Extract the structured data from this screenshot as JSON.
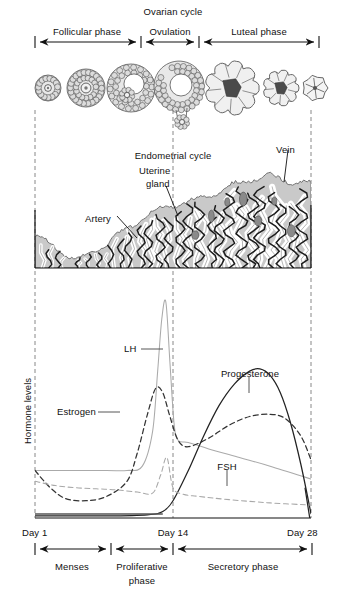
{
  "figure": {
    "width": 344,
    "height": 595
  },
  "ovarian_cycle": {
    "heading": "Ovarian cycle",
    "phases": [
      {
        "label": "Follicular phase",
        "start_day": 1,
        "end_day": 13,
        "x_start": 35,
        "x_end": 140
      },
      {
        "label": "Ovulation",
        "start_day": 13,
        "end_day": 16,
        "x_start": 143,
        "x_end": 198
      },
      {
        "label": "Luteal phase",
        "start_day": 16,
        "end_day": 28,
        "x_start": 201,
        "x_end": 318
      }
    ],
    "follicle_stages": [
      {
        "name": "primordial-follicle",
        "cx": 48,
        "r": 13,
        "type": "ring",
        "antrum": false
      },
      {
        "name": "primary-follicle",
        "cx": 86,
        "r": 19,
        "type": "ring",
        "antrum": false
      },
      {
        "name": "secondary-follicle",
        "cx": 131,
        "r": 24,
        "type": "antral",
        "antrum": true
      },
      {
        "name": "graafian-follicle",
        "cx": 180,
        "r": 25,
        "type": "rupture",
        "antrum": true
      },
      {
        "name": "corpus-luteum",
        "cx": 232,
        "r": 27,
        "type": "luteum",
        "antrum": true
      },
      {
        "name": "regressing-corpus-luteum",
        "cx": 281,
        "r": 18,
        "type": "luteum",
        "antrum": true
      },
      {
        "name": "corpus-albicans",
        "cx": 315,
        "r": 13,
        "type": "albicans",
        "antrum": true
      }
    ]
  },
  "endometrial_cycle": {
    "heading": "Endometrial cycle",
    "annotations": [
      {
        "label": "Artery",
        "name": "artery-label",
        "text_x": 108,
        "text_y": 218,
        "lead_to_x": 136,
        "lead_to_y": 236
      },
      {
        "label": "Uterine\ngland",
        "name": "uterine-gland-label",
        "line1": "Uterine",
        "line2": "gland",
        "text_x": 158,
        "text_y": 186,
        "lead_to_x": 176,
        "lead_to_y": 215
      },
      {
        "label": "Vein",
        "name": "vein-label",
        "text_x": 288,
        "text_y": 152,
        "lead_to_x": 283,
        "lead_to_y": 180
      }
    ]
  },
  "chart_data": {
    "type": "line",
    "xlabel": "",
    "ylabel": "Hormone levels",
    "x_tick_labels": [
      "Day 1",
      "Day 14",
      "Day 28"
    ],
    "x_ticks": [
      1,
      14,
      28
    ],
    "xlim": [
      1,
      28
    ],
    "ylim": [
      0,
      100
    ],
    "grid": false,
    "legend": "inline annotations",
    "series": [
      {
        "name": "LH",
        "style": "solid",
        "color": "#aaaaaa",
        "label_x": 133,
        "label_y": 349,
        "lead_to_x": 163,
        "lead_to_y": 349,
        "x": [
          1,
          4,
          8,
          10,
          11.5,
          12.5,
          13,
          13.4,
          13.8,
          14.2,
          14.6,
          15,
          16,
          18,
          21,
          24,
          28
        ],
        "values": [
          22,
          22,
          22,
          22,
          24,
          40,
          68,
          92,
          100,
          72,
          44,
          36,
          35,
          32,
          28,
          24,
          18
        ]
      },
      {
        "name": "Estrogen",
        "style": "dashed",
        "color": "#333333",
        "label_x": 60,
        "label_y": 413,
        "lead_to_x": 118,
        "lead_to_y": 413,
        "x": [
          1,
          2.5,
          4,
          6,
          8,
          10,
          11,
          12,
          12.8,
          13.5,
          14.2,
          15,
          16,
          18,
          20,
          22,
          24,
          25.5,
          27,
          28
        ],
        "values": [
          22,
          14,
          9,
          8,
          10,
          17,
          30,
          48,
          60,
          58,
          47,
          36,
          33,
          37,
          43,
          47,
          48,
          46,
          38,
          27
        ]
      },
      {
        "name": "Progesterone",
        "style": "solid",
        "color": "#222222",
        "label_x": 253,
        "label_y": 377,
        "lead_to_x": 249,
        "lead_to_y": 393,
        "x": [
          1,
          8,
          12,
          13.5,
          14.5,
          16,
          17.5,
          19,
          20.5,
          22,
          23,
          24,
          25,
          26,
          27,
          28
        ],
        "values": [
          1,
          1,
          1.5,
          3,
          8,
          22,
          38,
          52,
          62,
          68,
          69,
          66,
          58,
          44,
          25,
          2
        ]
      },
      {
        "name": "FSH",
        "style": "dashed",
        "color": "#a8a8a8",
        "label_x": 222,
        "label_y": 466,
        "lead_to_x": 227,
        "lead_to_y": 485,
        "x": [
          1,
          3,
          5,
          7,
          9,
          11,
          12.5,
          13.3,
          13.9,
          14.5,
          15.5,
          17,
          20,
          24,
          28
        ],
        "values": [
          17,
          15,
          14,
          13.5,
          13,
          12,
          11.5,
          20,
          28,
          14,
          11,
          10,
          8.5,
          7,
          6
        ]
      }
    ]
  },
  "axis": {
    "day_labels": [
      {
        "text": "Day 1",
        "x": 35,
        "align": "left"
      },
      {
        "text": "Day 14",
        "x": 173,
        "align": "center"
      },
      {
        "text": "Day 28",
        "x": 311,
        "align": "right"
      }
    ]
  },
  "uterine_phases": {
    "phases": [
      {
        "label": "Menses",
        "x_start": 35,
        "x_end": 110,
        "lines": [
          "Menses"
        ]
      },
      {
        "label": "Proliferative phase",
        "x_start": 113,
        "x_end": 171,
        "lines": [
          "Proliferative",
          "phase"
        ]
      },
      {
        "label": "Secretory phase",
        "x_start": 175,
        "x_end": 311,
        "lines": [
          "Secretory phase"
        ]
      }
    ]
  },
  "colors": {
    "ink": "#1a1a1a",
    "tissue_fill": "#c9c9c9",
    "gland_white": "#ffffff",
    "dark_gray": "#555555",
    "light_line": "#b0b0b0",
    "dashed_guide": "#888888"
  }
}
